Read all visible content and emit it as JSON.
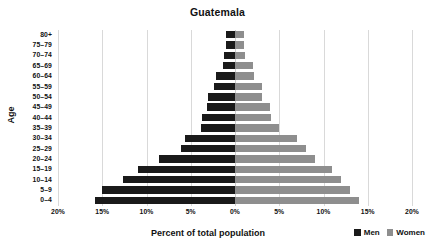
{
  "chart_data": {
    "type": "bar",
    "title": "Guatemala",
    "xlabel": "Percent of total population",
    "ylabel": "Age",
    "grid": true,
    "legend_position": "bottom-right",
    "xlim": [
      -20,
      20
    ],
    "xtick_labels": [
      "20%",
      "15%",
      "10%",
      "5%",
      "0%",
      "5%",
      "10%",
      "15%",
      "20%"
    ],
    "xtick_values": [
      -20,
      -15,
      -10,
      -5,
      0,
      5,
      10,
      15,
      20
    ],
    "categories": [
      "80+",
      "75–79",
      "70–74",
      "65–69",
      "60–64",
      "55–59",
      "50–54",
      "45–49",
      "40–44",
      "35–39",
      "30–34",
      "25–29",
      "20–24",
      "15–19",
      "10–14",
      "5–9",
      "0–4"
    ],
    "series": [
      {
        "name": "Men",
        "color": "#1a1a1a",
        "direction": "left",
        "values": [
          1.0,
          1.0,
          1.2,
          1.4,
          2.2,
          2.4,
          3.0,
          3.2,
          3.7,
          3.8,
          5.6,
          6.1,
          8.6,
          11.0,
          12.6,
          15.0,
          15.8
        ]
      },
      {
        "name": "Women",
        "color": "#8e8e8e",
        "direction": "right",
        "values": [
          1.0,
          1.0,
          1.1,
          2.0,
          2.1,
          3.0,
          3.1,
          4.0,
          4.1,
          5.0,
          7.0,
          8.0,
          9.0,
          11.0,
          12.0,
          13.0,
          14.0
        ]
      }
    ],
    "legend": [
      "Men",
      "Women"
    ]
  }
}
